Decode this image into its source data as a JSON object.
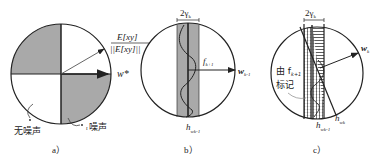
{
  "figure": {
    "panels": [
      {
        "id": "a",
        "caption": "a）",
        "vector_label_top_num": "E[xy]",
        "vector_label_top_den": "||E[xy]||",
        "vector_label_right": "w*",
        "annotation_left": "无噪声",
        "annotation_right": "噪声",
        "annotation_right_prefix": "ι"
      },
      {
        "id": "b",
        "caption": "b）",
        "band_label": "2γ",
        "band_label_sub": "k",
        "f_label": "f",
        "f_label_sub": "k+1",
        "w_label": "w",
        "w_label_sub": "k-1",
        "h_label": "h",
        "h_label_sub": "wk-1"
      },
      {
        "id": "c",
        "caption": "c）",
        "band_label": "2γ",
        "band_label_sub": "k",
        "w_label": "w",
        "w_label_sub": "k",
        "marked_label_line1": "由 f",
        "marked_label_sub": "k+1",
        "marked_label_line2": "标记",
        "h1_label": "h",
        "h1_label_sub": "wk-1",
        "h2_label": "h",
        "h2_label_sub": "wk"
      }
    ],
    "colors": {
      "shade": "#a9a9a9",
      "stroke": "#222222",
      "background": "#ffffff"
    }
  }
}
